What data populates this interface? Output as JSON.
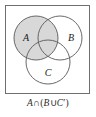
{
  "figure": {
    "type": "venn-diagram",
    "title_caption": "A ∩ (B ∪ C′)",
    "caption_parts": {
      "set_a": "A",
      "intersection": "∩",
      "open_paren": "(",
      "set_b": "B",
      "union": "∪",
      "set_c": "C",
      "complement_mark": "′",
      "close_paren": ")"
    },
    "universal_frame": {
      "label": "universal-set-rectangle",
      "stroke": "#6f6f6f",
      "fill": "#ffffff"
    },
    "colors": {
      "circle_stroke": "#585858",
      "shaded_fill": "#d8d8d8",
      "unshaded_fill": "#ffffff",
      "label_color": "#1a1a1a",
      "caption_color": "#2b2b2b",
      "frame_stroke": "#6f6f6f"
    },
    "circles": [
      {
        "label": "A",
        "name": "circle-a",
        "cx": 36,
        "cy": 38,
        "r": 22,
        "shaded": true,
        "label_x": 26,
        "label_y": 41
      },
      {
        "label": "B",
        "name": "circle-b",
        "cx": 60,
        "cy": 38,
        "r": 22,
        "shaded": false,
        "label_x": 71,
        "label_y": 41
      },
      {
        "label": "C",
        "name": "circle-c",
        "cx": 48,
        "cy": 62,
        "r": 22,
        "shaded": false,
        "label_x": 48,
        "label_y": 76
      }
    ],
    "shaded_regions": [
      "A only",
      "A ∩ B",
      "A ∩ C",
      "A ∩ B ∩ C"
    ],
    "shaded_description": "All of circle A is shaded",
    "set_labels": [
      "A",
      "B",
      "C"
    ]
  }
}
